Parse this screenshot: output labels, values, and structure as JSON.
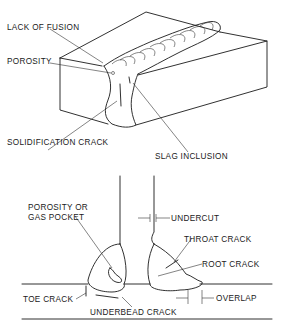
{
  "diagram": {
    "type": "weld-defects-illustration",
    "top_view": {
      "description": "Butt weld in block, isometric cut-away",
      "labels": [
        {
          "id": "lack-of-fusion",
          "text": "LACK OF FUSION"
        },
        {
          "id": "porosity",
          "text": "POROSITY"
        },
        {
          "id": "solidification-crack",
          "text": "SOLIDIFICATION CRACK"
        },
        {
          "id": "slag-inclusion",
          "text": "SLAG INCLUSION"
        }
      ]
    },
    "bottom_view": {
      "description": "Fillet welds on T-joint, cross-section",
      "labels": [
        {
          "id": "porosity-or-gas-pocket",
          "text_line1": "POROSITY OR",
          "text_line2": "GAS POCKET"
        },
        {
          "id": "undercut",
          "text": "UNDERCUT"
        },
        {
          "id": "throat-crack",
          "text": "THROAT CRACK"
        },
        {
          "id": "root-crack",
          "text": "ROOT CRACK"
        },
        {
          "id": "toe-crack",
          "text": "TOE CRACK"
        },
        {
          "id": "overlap",
          "text": "OVERLAP"
        },
        {
          "id": "underbead-crack",
          "text": "UNDERBEAD CRACK"
        }
      ]
    }
  }
}
